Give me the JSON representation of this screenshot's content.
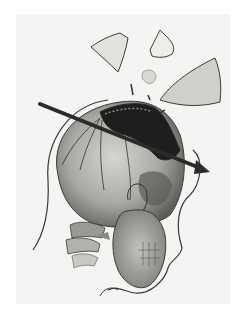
{
  "image": {
    "subject": "Illustration of a human skull penetrated by a projectile with bone fragments displaced above",
    "palette": {
      "background": "#f4f4f2",
      "paper": "#ffffff",
      "bone_light": "#cfcfca",
      "bone_mid": "#9a9a95",
      "bone_dark": "#4a4a48",
      "wound": "#1e1e1e",
      "outline": "#3a3a3a",
      "arrow": "#2b2b2b"
    },
    "elements": [
      "skull",
      "entry-wound-cavity",
      "projectile-arrow",
      "bone-fragments",
      "head-outline",
      "mandible",
      "cervical-vertebrae"
    ]
  }
}
